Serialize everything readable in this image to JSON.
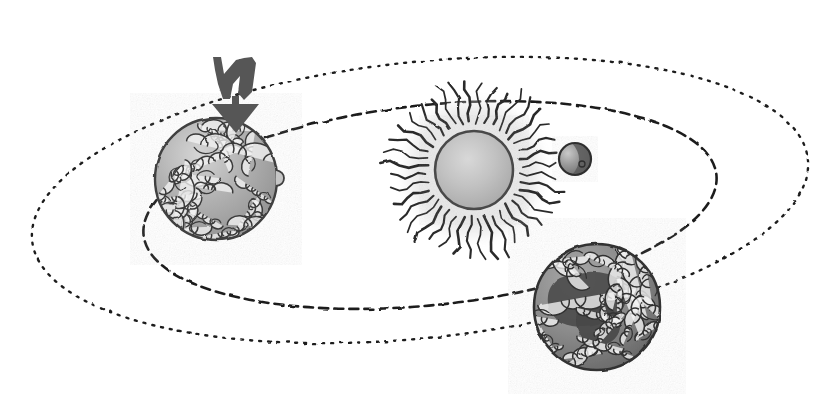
{
  "illustration": {
    "title": "Solar System Orbital Diagram",
    "style": "hand-drawn grayscale ink and wash sketch",
    "background_color": "#ffffff",
    "width": 839,
    "height": 394
  },
  "arrow": {
    "name": "double-chevron-down-arrow",
    "label": "downward pointing double arrow",
    "color": "#555555",
    "x": 213,
    "y": 55,
    "width": 46,
    "height": 78
  },
  "sun": {
    "name": "sun",
    "label": "Sun",
    "center_x": 474,
    "center_y": 170,
    "radius": 39,
    "body_color": "#b9b9b9",
    "edge_color": "#4a4a4a",
    "glow_color": "#e8e8e8",
    "ray_count": 40,
    "ray_color": "#333333",
    "ray_style": "wavy radiating lines",
    "ray_inner_radius": 46,
    "ray_outer_radius": 88
  },
  "planets": [
    {
      "name": "planet-left-cloudy",
      "label": "Cloud-covered planet (left)",
      "center_x": 216,
      "center_y": 179,
      "radius": 61,
      "body_color": "#a9a9a9",
      "highlight_color": "#d7d7d7",
      "edge_color": "#3f3f3f",
      "surface": "swirling cloud patterns",
      "cloud_color": "#f2f2f2",
      "cloud_outline": "#3a3a3a",
      "has_shadow_region": false
    },
    {
      "name": "planet-inner-small",
      "label": "Small inner planet",
      "center_x": 575,
      "center_y": 159,
      "radius": 16,
      "body_color": "#8e8e8e",
      "highlight_color": "#c4c4c4",
      "edge_color": "#2e2e2e",
      "surface": "half-lit crescent with dark terminator",
      "has_shadow_region": true
    },
    {
      "name": "planet-right-dark",
      "label": "Dark cloud-covered planet (lower right)",
      "center_x": 597,
      "center_y": 307,
      "radius": 63,
      "body_color": "#8b8b8b",
      "highlight_color": "#a5a5a5",
      "edge_color": "#333333",
      "surface": "swirling clouds with large dark landmass",
      "cloud_color": "#f4f4f4",
      "cloud_outline": "#303030",
      "landmass_color": "#4d4d4d",
      "has_shadow_region": true
    }
  ],
  "orbits": [
    {
      "name": "orbit-outer",
      "label": "Outer orbital path",
      "center_x": 420,
      "center_y": 200,
      "radius_x": 390,
      "radius_y": 138,
      "rotation_deg": -6,
      "stroke_color": "#1f1f1f",
      "stroke_width": 2.4,
      "dash_pattern": "2 7",
      "style": "fine dotted ellipse"
    },
    {
      "name": "orbit-inner",
      "label": "Inner orbital path",
      "center_x": 430,
      "center_y": 205,
      "radius_x": 288,
      "radius_y": 100,
      "rotation_deg": -6,
      "stroke_color": "#1f1f1f",
      "stroke_width": 2.6,
      "dash_pattern": "9 6",
      "style": "dashed ellipse"
    }
  ]
}
